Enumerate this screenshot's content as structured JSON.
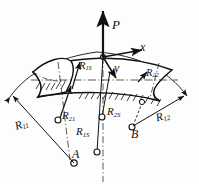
{
  "figure": {
    "kind": "engineering-diagram",
    "background_color": "#fdfdfd",
    "ink_color": "#111111"
  },
  "labels": {
    "load": {
      "text": "P",
      "base": "P",
      "sub": ""
    },
    "axis_x": {
      "text": "x",
      "base": "x",
      "sub": ""
    },
    "axis_y": {
      "text": "y",
      "base": "y",
      "sub": ""
    },
    "r11": {
      "text": "R11",
      "base": "R",
      "sub": "11"
    },
    "r12": {
      "text": "R12",
      "base": "R",
      "sub": "12"
    },
    "r1s": {
      "text": "R1S",
      "base": "R",
      "sub": "1S"
    },
    "r1s_upper": {
      "text": "R1S",
      "base": "R",
      "sub": "1S"
    },
    "r21": {
      "text": "R21",
      "base": "R",
      "sub": "21"
    },
    "r22": {
      "text": "R22",
      "base": "R",
      "sub": "22"
    },
    "r2s": {
      "text": "R2S",
      "base": "R",
      "sub": "2S"
    },
    "point_a": {
      "text": "A",
      "base": "A",
      "sub": ""
    },
    "point_b": {
      "text": "B",
      "base": "B",
      "sub": ""
    }
  }
}
